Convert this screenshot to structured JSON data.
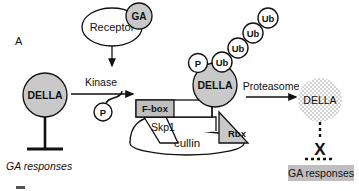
{
  "figure": {
    "panel_label": "A",
    "background_color": "#ffffff",
    "line_color": "#111111",
    "fill_gray": "#c9c9c9",
    "fill_light_gray": "#d8d8d8",
    "fill_box_gray": "#bfbfbf",
    "fill_white": "#ffffff"
  },
  "nodes": {
    "ga": "GA",
    "receptor": "Receptor",
    "kinase": "Kinase",
    "phospho_free": "P",
    "phospho_bound": "P",
    "della_left": "DELLA",
    "della_bound": "DELLA",
    "della_degraded": "DELLA",
    "fbox": "F-box",
    "skp1": "Skp1",
    "cullin": "cullin",
    "rbx": "Rbx",
    "proteasome": "Proteasome",
    "ubiquitins": [
      "Ub",
      "Ub",
      "Ub",
      "Ub"
    ]
  },
  "labels": {
    "ga_responses_inhibited": "GA responses",
    "ga_responses_active": "GA responses"
  }
}
